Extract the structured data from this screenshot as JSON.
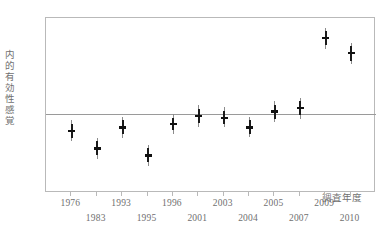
{
  "chart_data": {
    "type": "scatter",
    "title": "",
    "xlabel": "調査年度",
    "ylabel": "内的有効性感覚",
    "xlim": [
      0,
      13
    ],
    "ylim": [
      4.0,
      5.0
    ],
    "yticks": [
      "5.0",
      "4.8",
      "4.6",
      "4.4",
      "4.2",
      "4.0"
    ],
    "ytick_values": [
      5.0,
      4.8,
      4.6,
      4.4,
      4.2,
      4.0
    ],
    "categories": [
      "1976",
      "1983",
      "1993",
      "1995",
      "1996",
      "2001",
      "2003",
      "2004",
      "2005",
      "2007",
      "2009",
      "2010"
    ],
    "grid": false,
    "legend": "none",
    "reference_line": 4.45,
    "error_bar_style": "point-estimate-with-confidence-interval",
    "points": [
      {
        "x": "1976",
        "row": 0,
        "value": 4.355,
        "ci_low": 4.295,
        "ci_high": 4.415,
        "inner_low": 4.315,
        "inner_high": 4.395
      },
      {
        "x": "1983",
        "row": 1,
        "value": 4.255,
        "ci_low": 4.195,
        "ci_high": 4.315,
        "inner_low": 4.215,
        "inner_high": 4.295
      },
      {
        "x": "1993",
        "row": 0,
        "value": 4.375,
        "ci_low": 4.315,
        "ci_high": 4.435,
        "inner_low": 4.335,
        "inner_high": 4.415
      },
      {
        "x": "1995",
        "row": 1,
        "value": 4.215,
        "ci_low": 4.155,
        "ci_high": 4.275,
        "inner_low": 4.175,
        "inner_high": 4.255
      },
      {
        "x": "1996",
        "row": 0,
        "value": 4.395,
        "ci_low": 4.34,
        "ci_high": 4.45,
        "inner_low": 4.36,
        "inner_high": 4.43
      },
      {
        "x": "2001",
        "row": 1,
        "value": 4.44,
        "ci_low": 4.375,
        "ci_high": 4.505,
        "inner_low": 4.4,
        "inner_high": 4.48
      },
      {
        "x": "2003",
        "row": 0,
        "value": 4.43,
        "ci_low": 4.375,
        "ci_high": 4.49,
        "inner_low": 4.395,
        "inner_high": 4.47
      },
      {
        "x": "2004",
        "row": 1,
        "value": 4.375,
        "ci_low": 4.32,
        "ci_high": 4.435,
        "inner_low": 4.34,
        "inner_high": 4.415
      },
      {
        "x": "2005",
        "row": 0,
        "value": 4.465,
        "ci_low": 4.405,
        "ci_high": 4.525,
        "inner_low": 4.425,
        "inner_high": 4.505
      },
      {
        "x": "2007",
        "row": 1,
        "value": 4.485,
        "ci_low": 4.425,
        "ci_high": 4.545,
        "inner_low": 4.445,
        "inner_high": 4.525
      },
      {
        "x": "2009",
        "row": 0,
        "value": 4.885,
        "ci_low": 4.825,
        "ci_high": 4.945,
        "inner_low": 4.845,
        "inner_high": 4.925
      },
      {
        "x": "2010",
        "row": 1,
        "value": 4.8,
        "ci_low": 4.735,
        "ci_high": 4.86,
        "inner_low": 4.755,
        "inner_high": 4.84
      }
    ]
  },
  "axes": {
    "y_title": "内的有効性感覚",
    "x_title": "調査年度"
  }
}
